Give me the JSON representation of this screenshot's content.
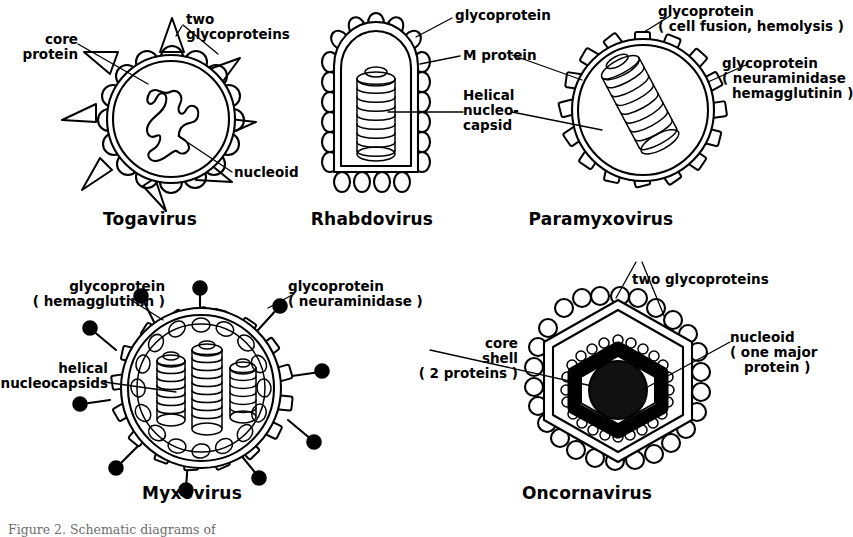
{
  "figure": {
    "background_color": "#ffffff",
    "ink_color": "#000000",
    "caption_partial": "Figure 2.  Schematic diagrams of"
  },
  "panels": [
    {
      "id": "togavirus",
      "title": "Togavirus",
      "labels": [
        {
          "name": "core-protein",
          "text_line1": "core",
          "text_line2": "protein"
        },
        {
          "name": "two-glycoproteins",
          "text_line1": "two",
          "text_line2": "glycoproteins"
        },
        {
          "name": "nucleoid",
          "text_line1": "nucleoid"
        }
      ]
    },
    {
      "id": "rhabdovirus",
      "title": "Rhabdovirus",
      "labels": [
        {
          "name": "glycoprotein",
          "text_line1": "glycoprotein"
        },
        {
          "name": "m-protein",
          "text_line1": "M protein"
        },
        {
          "name": "helical-nucleocapsid",
          "text_line1": "Helical",
          "text_line2": "nucleo-",
          "text_line3": "capsid"
        }
      ]
    },
    {
      "id": "paramyxovirus",
      "title": "Paramyxovirus",
      "labels": [
        {
          "name": "glycoprotein-fusion",
          "text_line1": "glycoprotein",
          "text_line2": "( cell fusion, hemolysis )"
        },
        {
          "name": "glycoprotein-neuraminidase",
          "text_line1": "glycoprotein",
          "text_line2": "( neuraminidase",
          "text_line3": "hemagglutinin )"
        }
      ]
    },
    {
      "id": "myxovirus",
      "title": "Myxovirus",
      "labels": [
        {
          "name": "glycoprotein-hemagglutinin",
          "text_line1": "glycoprotein",
          "text_line2": "( hemagglutinin )"
        },
        {
          "name": "glycoprotein-neuraminidase",
          "text_line1": "glycoprotein",
          "text_line2": "( neuraminidase )"
        },
        {
          "name": "helical-nucleocapsids",
          "text_line1": "helical",
          "text_line2": "nucleocapsids"
        }
      ]
    },
    {
      "id": "oncornavirus",
      "title": "Oncornavirus",
      "labels": [
        {
          "name": "two-glycoproteins",
          "text_line1": "two  glycoproteins"
        },
        {
          "name": "core-shell",
          "text_line1": "core",
          "text_line2": "shell",
          "text_line3": "( 2 proteins )"
        },
        {
          "name": "nucleoid",
          "text_line1": "nucleoid",
          "text_line2": "( one major",
          "text_line3": "protein )"
        }
      ]
    }
  ]
}
